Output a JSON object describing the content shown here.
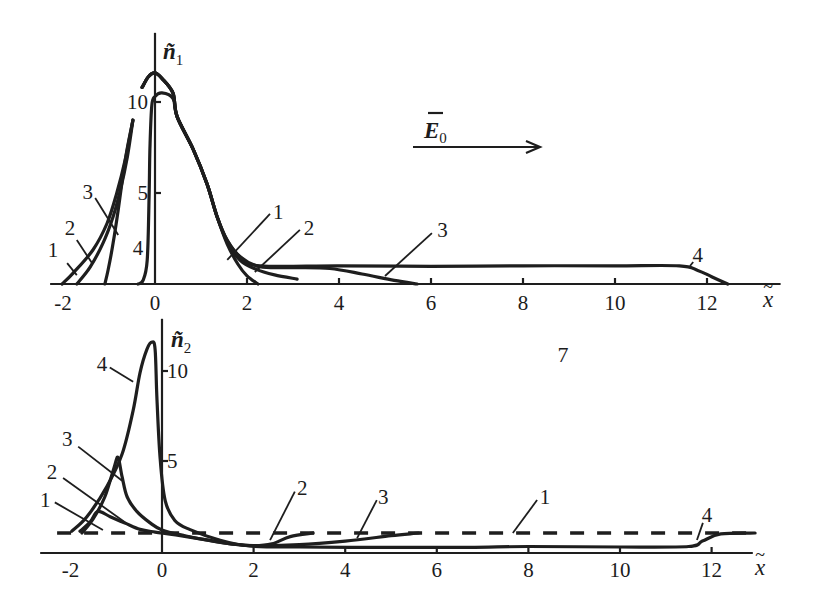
{
  "figure": {
    "panel_number": "7",
    "field_vector": {
      "symbol": "E",
      "sub": "0",
      "accent": "→"
    }
  },
  "chart_data": [
    {
      "type": "line",
      "panel": "top",
      "title": "",
      "ylabel": {
        "symbol": "ñ",
        "sub": "1"
      },
      "xlabel": {
        "symbol": "x",
        "accent": "~"
      },
      "xlim": [
        -2.28,
        13.6
      ],
      "ylim": [
        0,
        13.8
      ],
      "xticks": [
        -2,
        0,
        2,
        4,
        6,
        8,
        10,
        12
      ],
      "yticks": [
        5,
        10
      ],
      "ytick_label_side": "left",
      "grid": false,
      "legend": "inline numeric curve labels",
      "series": [
        {
          "name": "1",
          "style": "solid",
          "segments": [
            [
              [
                -2.02,
                0
              ],
              [
                -1.78,
                0.6
              ],
              [
                -1.35,
                1.87
              ],
              [
                -1.04,
                3.35
              ],
              [
                -0.83,
                5.0
              ],
              [
                -0.65,
                6.8
              ],
              [
                -0.48,
                9.0
              ]
            ],
            [
              [
                -0.28,
                10.8
              ],
              [
                -0.14,
                11.4
              ],
              [
                0,
                11.6
              ],
              [
                0.15,
                11.3
              ],
              [
                0.39,
                10.5
              ],
              [
                0.48,
                9.2
              ],
              [
                0.83,
                7.4
              ],
              [
                1.13,
                5.5
              ],
              [
                1.35,
                3.7
              ],
              [
                1.57,
                2.2
              ],
              [
                1.8,
                1.1
              ],
              [
                2.0,
                0.45
              ],
              [
                2.24,
                0
              ]
            ]
          ]
        },
        {
          "name": "2",
          "style": "solid",
          "segments": [
            [
              [
                -1.7,
                0
              ],
              [
                -1.41,
                0.93
              ],
              [
                -1.13,
                2.25
              ],
              [
                -0.91,
                3.7
              ],
              [
                -0.75,
                5.2
              ],
              [
                -0.6,
                7.0
              ],
              [
                -0.48,
                9.0
              ]
            ],
            [
              [
                -0.28,
                10.8
              ],
              [
                -0.14,
                11.4
              ],
              [
                0,
                11.6
              ],
              [
                0.15,
                11.3
              ],
              [
                0.39,
                10.5
              ],
              [
                0.48,
                9.2
              ],
              [
                0.83,
                7.4
              ],
              [
                1.13,
                5.5
              ],
              [
                1.35,
                3.7
              ],
              [
                1.57,
                2.3
              ],
              [
                1.85,
                1.3
              ],
              [
                2.2,
                0.8
              ],
              [
                2.6,
                0.5
              ],
              [
                3.09,
                0.27
              ]
            ]
          ]
        },
        {
          "name": "3",
          "style": "solid",
          "segments": [
            [
              [
                -1.09,
                0
              ],
              [
                -1.02,
                0.77
              ],
              [
                -0.91,
                2.25
              ],
              [
                -0.8,
                4.07
              ],
              [
                -0.7,
                5.9
              ],
              [
                -0.6,
                7.5
              ],
              [
                -0.48,
                9.0
              ]
            ],
            [
              [
                -0.28,
                10.8
              ],
              [
                -0.14,
                11.4
              ],
              [
                0,
                11.6
              ],
              [
                0.15,
                11.3
              ],
              [
                0.39,
                10.5
              ],
              [
                0.48,
                9.2
              ],
              [
                0.83,
                7.4
              ],
              [
                1.13,
                5.5
              ],
              [
                1.35,
                3.7
              ],
              [
                1.57,
                2.4
              ],
              [
                1.85,
                1.5
              ],
              [
                2.28,
                0.95
              ],
              [
                3.0,
                0.9
              ],
              [
                3.8,
                0.85
              ],
              [
                4.5,
                0.55
              ],
              [
                5.2,
                0.2
              ],
              [
                5.7,
                0
              ]
            ]
          ]
        },
        {
          "name": "4",
          "style": "solid",
          "segments": [
            [
              [
                -0.37,
                0
              ],
              [
                -0.26,
                0.2
              ],
              [
                -0.17,
                1.3
              ],
              [
                -0.13,
                4.6
              ],
              [
                -0.11,
                7.4
              ],
              [
                -0.07,
                9.8
              ],
              [
                0.0,
                10.3
              ],
              [
                0.15,
                10.5
              ],
              [
                0.39,
                10.2
              ],
              [
                0.48,
                9.2
              ],
              [
                0.83,
                7.4
              ],
              [
                1.13,
                5.5
              ],
              [
                1.35,
                3.7
              ],
              [
                1.57,
                2.4
              ],
              [
                1.85,
                1.5
              ],
              [
                2.28,
                1.0
              ],
              [
                4,
                1.0
              ],
              [
                6,
                0.97
              ],
              [
                8,
                1.0
              ],
              [
                10,
                1.0
              ],
              [
                11.4,
                1.0
              ],
              [
                11.8,
                0.75
              ],
              [
                12.1,
                0.4
              ],
              [
                12.45,
                0
              ]
            ]
          ]
        }
      ],
      "annotations": [
        {
          "text": "1",
          "at": [
            -2.22,
            1.87
          ],
          "leader": [
            [
              -1.91,
              1.15
            ],
            [
              -1.7,
              0.49
            ]
          ]
        },
        {
          "text": "2",
          "at": [
            -1.85,
            3.08
          ],
          "leader": [
            [
              -1.7,
              2.42
            ],
            [
              -1.37,
              1.15
            ]
          ]
        },
        {
          "text": "3",
          "at": [
            -1.46,
            5.05
          ],
          "leader": [
            [
              -1.3,
              4.73
            ],
            [
              -0.8,
              2.69
            ]
          ]
        },
        {
          "text": "4",
          "at": [
            -0.37,
            1.98
          ]
        },
        {
          "text": "1",
          "at": [
            2.68,
            3.96
          ],
          "leader": [
            [
              2.5,
              3.85
            ],
            [
              1.57,
              1.32
            ]
          ]
        },
        {
          "text": "2",
          "at": [
            3.35,
            3.08
          ],
          "leader": [
            [
              3.15,
              2.97
            ],
            [
              2.17,
              0.66
            ]
          ]
        },
        {
          "text": "3",
          "at": [
            6.25,
            2.97
          ],
          "leader": [
            [
              6.02,
              2.8
            ],
            [
              5.0,
              0.44
            ]
          ]
        },
        {
          "text": "4",
          "at": [
            11.8,
            1.6
          ],
          "leader": [
            [
              11.7,
              1.21
            ],
            [
              11.63,
              0.99
            ]
          ]
        }
      ]
    },
    {
      "type": "line",
      "panel": "bottom",
      "title": "",
      "ylabel": {
        "symbol": "ñ",
        "sub": "2"
      },
      "xlabel": {
        "symbol": "x",
        "accent": "~"
      },
      "xlim": [
        -2.66,
        12.9
      ],
      "ylim": [
        0,
        12.9
      ],
      "xticks": [
        -2,
        0,
        2,
        4,
        6,
        8,
        10,
        12
      ],
      "yticks": [
        5,
        10
      ],
      "ytick_label_side": "right",
      "grid": false,
      "legend": "inline numeric curve labels",
      "series": [
        {
          "name": "1",
          "style": "dashed",
          "segments": [
            [
              [
                -2.29,
                1.0
              ],
              [
                12.95,
                1.0
              ]
            ]
          ]
        },
        {
          "name": "2",
          "style": "solid",
          "segments": [
            [
              [
                -1.79,
                1.1
              ],
              [
                -1.57,
                1.6
              ],
              [
                -1.4,
                2.2
              ],
              [
                -1.13,
                1.9
              ],
              [
                -0.81,
                1.55
              ],
              [
                -0.48,
                1.2
              ],
              [
                -0.15,
                1.05
              ],
              [
                0.3,
                0.9
              ],
              [
                1.0,
                0.6
              ],
              [
                1.5,
                0.4
              ],
              [
                2.0,
                0.3
              ],
              [
                2.4,
                0.4
              ],
              [
                2.8,
                0.8
              ],
              [
                3.3,
                1.0
              ]
            ]
          ]
        },
        {
          "name": "3",
          "style": "solid",
          "segments": [
            [
              [
                -1.75,
                1.0
              ],
              [
                -1.5,
                1.8
              ],
              [
                -1.25,
                3.0
              ],
              [
                -1.05,
                4.6
              ],
              [
                -0.96,
                5.2
              ],
              [
                -0.87,
                4.1
              ],
              [
                -0.76,
                3.0
              ],
              [
                -0.55,
                2.2
              ],
              [
                -0.26,
                1.56
              ],
              [
                0,
                1.17
              ],
              [
                0.5,
                0.85
              ],
              [
                1.0,
                0.6
              ],
              [
                1.5,
                0.4
              ],
              [
                2.0,
                0.3
              ],
              [
                3.0,
                0.35
              ],
              [
                4.0,
                0.55
              ],
              [
                5.0,
                0.85
              ],
              [
                5.6,
                1.0
              ]
            ]
          ]
        },
        {
          "name": "4",
          "style": "solid",
          "segments": [
            [
              [
                -1.97,
                1.1
              ],
              [
                -1.64,
                1.9
              ],
              [
                -1.2,
                3.6
              ],
              [
                -0.87,
                5.4
              ],
              [
                -0.63,
                7.8
              ],
              [
                -0.48,
                9.9
              ],
              [
                -0.33,
                11.2
              ],
              [
                -0.22,
                11.6
              ],
              [
                -0.15,
                11.2
              ],
              [
                -0.11,
                8.4
              ],
              [
                -0.04,
                5.1
              ],
              [
                0.07,
                2.8
              ],
              [
                0.28,
                1.7
              ],
              [
                0.6,
                1.2
              ],
              [
                1.27,
                0.6
              ],
              [
                1.92,
                0.28
              ],
              [
                3,
                0.22
              ],
              [
                5,
                0.2
              ],
              [
                6.7,
                0.2
              ],
              [
                8,
                0.25
              ],
              [
                10,
                0.22
              ],
              [
                11.5,
                0.25
              ],
              [
                11.8,
                0.55
              ],
              [
                12.2,
                0.95
              ],
              [
                12.95,
                1.0
              ]
            ]
          ]
        }
      ],
      "annotations": [
        {
          "text": "4",
          "at": [
            -1.31,
            10.4
          ],
          "leader": [
            [
              -1.14,
              10.2
            ],
            [
              -0.63,
              9.4
            ]
          ]
        },
        {
          "text": "3",
          "at": [
            -2.07,
            6.2
          ],
          "leader": [
            [
              -1.83,
              5.8
            ],
            [
              -0.87,
              3.9
            ]
          ]
        },
        {
          "text": "2",
          "at": [
            -2.4,
            4.4
          ],
          "leader": [
            [
              -2.16,
              4.05
            ],
            [
              -0.81,
              1.6
            ]
          ]
        },
        {
          "text": "1",
          "at": [
            -2.55,
            2.83
          ],
          "leader": [
            [
              -2.34,
              2.7
            ],
            [
              -1.29,
              1.17
            ]
          ]
        },
        {
          "text": "2",
          "at": [
            3.06,
            3.5
          ],
          "leader": [
            [
              2.9,
              3.3
            ],
            [
              2.36,
              0.6
            ]
          ]
        },
        {
          "text": "3",
          "at": [
            4.83,
            3.0
          ],
          "leader": [
            [
              4.69,
              2.83
            ],
            [
              4.26,
              0.72
            ]
          ]
        },
        {
          "text": "1",
          "at": [
            8.36,
            3.0
          ],
          "leader": [
            [
              8.19,
              2.83
            ],
            [
              7.66,
              1.0
            ]
          ]
        },
        {
          "text": "4",
          "at": [
            11.9,
            2.0
          ],
          "leader": [
            [
              11.81,
              1.56
            ],
            [
              11.68,
              0.61
            ]
          ]
        }
      ]
    }
  ]
}
